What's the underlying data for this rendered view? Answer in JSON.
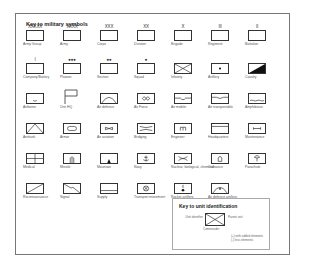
{
  "title": "Key to military symbols",
  "symbols": [
    {
      "label": "Army Group",
      "mark": "XXXXX",
      "glyph": "box"
    },
    {
      "label": "Army",
      "mark": "XXXX",
      "glyph": "box"
    },
    {
      "label": "Corps",
      "mark": "XXX",
      "glyph": "box"
    },
    {
      "label": "Division",
      "mark": "XX",
      "glyph": "box"
    },
    {
      "label": "Brigade",
      "mark": "X",
      "glyph": "box"
    },
    {
      "label": "Regiment",
      "mark": "III",
      "glyph": "box"
    },
    {
      "label": "Battalion",
      "mark": "II",
      "glyph": "box"
    },
    {
      "label": "Company/Battery",
      "mark": "I",
      "glyph": "box"
    },
    {
      "label": "Platoon",
      "mark": "●●●",
      "glyph": "box"
    },
    {
      "label": "Section",
      "mark": "●●",
      "glyph": "box"
    },
    {
      "label": "Squad",
      "mark": "●",
      "glyph": "box"
    },
    {
      "label": "Infantry",
      "mark": "",
      "glyph": "infantry"
    },
    {
      "label": "Artillery",
      "mark": "",
      "glyph": "artillery"
    },
    {
      "label": "Cavalry",
      "mark": "",
      "glyph": "cavalry"
    },
    {
      "label": "Airborne",
      "mark": "",
      "glyph": "airborne"
    },
    {
      "label": "Unit HQ",
      "mark": "",
      "glyph": "flag"
    },
    {
      "label": "Air defence",
      "mark": "",
      "glyph": "airdefence"
    },
    {
      "label": "Air Force",
      "mark": "",
      "glyph": "airforce"
    },
    {
      "label": "Air mobile",
      "mark": "",
      "glyph": "airmobile"
    },
    {
      "label": "Air transportable",
      "mark": "",
      "glyph": "airtransport"
    },
    {
      "label": "Amphibious",
      "mark": "",
      "glyph": "amphibious"
    },
    {
      "label": "Antitank",
      "mark": "",
      "glyph": "antitank"
    },
    {
      "label": "Armor",
      "mark": "",
      "glyph": "armor"
    },
    {
      "label": "Air aviation",
      "mark": "",
      "glyph": "aviation"
    },
    {
      "label": "Bridging",
      "mark": "",
      "glyph": "bridging"
    },
    {
      "label": "Engineer",
      "mark": "",
      "glyph": "engineer"
    },
    {
      "label": "Headquarters",
      "mark": "",
      "glyph": "hq"
    },
    {
      "label": "Maintenance",
      "mark": "",
      "glyph": "maintenance"
    },
    {
      "label": "Medical",
      "mark": "",
      "glyph": "medical"
    },
    {
      "label": "Missile",
      "mark": "",
      "glyph": "missile"
    },
    {
      "label": "Mountain",
      "mark": "",
      "glyph": "mountain"
    },
    {
      "label": "Navy",
      "mark": "",
      "glyph": "navy"
    },
    {
      "label": "Nuclear, biological, chemical",
      "mark": "",
      "glyph": "nbc"
    },
    {
      "label": "Ordnance",
      "mark": "",
      "glyph": "ordnance"
    },
    {
      "label": "Parachute",
      "mark": "",
      "glyph": "parachute"
    },
    {
      "label": "Reconnaissance",
      "mark": "",
      "glyph": "recon"
    },
    {
      "label": "Signal",
      "mark": "",
      "glyph": "signal"
    },
    {
      "label": "Supply",
      "mark": "",
      "glyph": "supply"
    },
    {
      "label": "Transport movement",
      "mark": "",
      "glyph": "transport"
    },
    {
      "label": "Rocket artillery",
      "mark": "",
      "glyph": "rocket"
    },
    {
      "label": "Air defence artillery",
      "mark": "",
      "glyph": "adartillery"
    }
  ],
  "unit_key": {
    "title": "Key to unit identification",
    "left_label": "Unit identifier",
    "right_label": "Parent unit",
    "bottom_label": "Commander",
    "note1": "(+) with added elements",
    "note2": "(-) less elements"
  }
}
